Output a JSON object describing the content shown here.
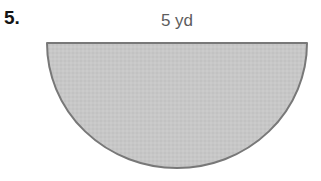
{
  "page": {
    "background_color": "#ffffff",
    "width": 321,
    "height": 181
  },
  "problem": {
    "number_label": "5.",
    "number_color": "#141414"
  },
  "figure": {
    "shape_name": "half-ellipse",
    "shape_description": "Shaded semicircle with flat side on top",
    "dimension_label": "5 yd",
    "dimension_label_color": "#5d5d5d",
    "fill_color": "#c6c6c6",
    "stroke_color": "#787878",
    "stroke_width": 2,
    "geometry": {
      "flat_edge_left_x": 3,
      "flat_edge_right_x": 263,
      "flat_edge_y": 3,
      "arc_bottom_y": 128,
      "radius_x": 130,
      "radius_y": 125
    }
  }
}
